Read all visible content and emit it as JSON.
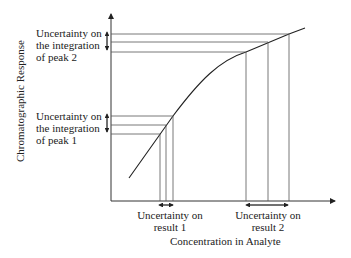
{
  "diagram": {
    "y_axis_label": "Chromatographic Response",
    "x_axis_label": "Concentration in Analyte",
    "peak2": {
      "line1": "Uncertainty on",
      "line2": "the integration",
      "line3": "of peak 2"
    },
    "peak1": {
      "line1": "Uncertainty on",
      "line2": "the integration",
      "line3": "of peak 1"
    },
    "result1": {
      "line1": "Uncertainty on",
      "line2": "result 1"
    },
    "result2": {
      "line1": "Uncertainty on",
      "line2": "result 2"
    }
  }
}
